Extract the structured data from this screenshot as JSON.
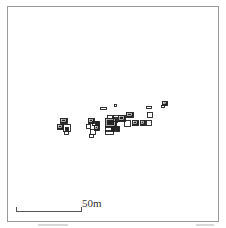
{
  "map": {
    "scale_label": "50m",
    "frame_color": "#9a9a9a",
    "feature_color": "#222222"
  },
  "features": [
    {
      "x": 60,
      "y": 118,
      "w": 7,
      "h": 5,
      "fill": true
    },
    {
      "x": 57,
      "y": 124,
      "w": 6,
      "h": 5,
      "fill": true
    },
    {
      "x": 63,
      "y": 124,
      "w": 7,
      "h": 7,
      "fill": false
    },
    {
      "x": 65,
      "y": 127,
      "w": 3,
      "h": 3,
      "fill": true
    },
    {
      "x": 64,
      "y": 131,
      "w": 4,
      "h": 3,
      "fill": false
    },
    {
      "x": 88,
      "y": 118,
      "w": 6,
      "h": 5,
      "fill": true
    },
    {
      "x": 86,
      "y": 124,
      "w": 4,
      "h": 4,
      "fill": false
    },
    {
      "x": 92,
      "y": 121,
      "w": 5,
      "h": 4,
      "fill": false
    },
    {
      "x": 95,
      "y": 121,
      "w": 4,
      "h": 4,
      "fill": true
    },
    {
      "x": 94,
      "y": 125,
      "w": 5,
      "h": 5,
      "fill": true
    },
    {
      "x": 90,
      "y": 129,
      "w": 5,
      "h": 5,
      "fill": false
    },
    {
      "x": 89,
      "y": 134,
      "w": 4,
      "h": 3,
      "fill": false
    },
    {
      "x": 107,
      "y": 115,
      "w": 5,
      "h": 5,
      "fill": false
    },
    {
      "x": 112,
      "y": 117,
      "w": 5,
      "h": 5,
      "fill": false
    },
    {
      "x": 105,
      "y": 118,
      "w": 11,
      "h": 9,
      "fill": true
    },
    {
      "x": 113,
      "y": 115,
      "w": 6,
      "h": 6,
      "fill": false
    },
    {
      "x": 118,
      "y": 115,
      "w": 7,
      "h": 6,
      "fill": true
    },
    {
      "x": 105,
      "y": 126,
      "w": 6,
      "h": 5,
      "fill": false
    },
    {
      "x": 111,
      "y": 126,
      "w": 4,
      "h": 5,
      "fill": true
    },
    {
      "x": 105,
      "y": 130,
      "w": 8,
      "h": 4,
      "fill": false
    },
    {
      "x": 116,
      "y": 126,
      "w": 3,
      "h": 5,
      "fill": true
    },
    {
      "x": 126,
      "y": 112,
      "w": 7,
      "h": 5,
      "fill": true
    },
    {
      "x": 124,
      "y": 120,
      "w": 6,
      "h": 6,
      "fill": false
    },
    {
      "x": 132,
      "y": 120,
      "w": 6,
      "h": 5,
      "fill": true
    },
    {
      "x": 140,
      "y": 120,
      "w": 5,
      "h": 5,
      "fill": true
    },
    {
      "x": 146,
      "y": 120,
      "w": 5,
      "h": 5,
      "fill": false
    },
    {
      "x": 147,
      "y": 112,
      "w": 5,
      "h": 5,
      "fill": false
    },
    {
      "x": 162,
      "y": 101,
      "w": 5,
      "h": 4,
      "fill": true
    },
    {
      "x": 161,
      "y": 105,
      "w": 3,
      "h": 2,
      "fill": false
    },
    {
      "x": 100,
      "y": 107,
      "w": 6,
      "h": 2,
      "fill": false
    },
    {
      "x": 114,
      "y": 104,
      "w": 2,
      "h": 2,
      "fill": false
    },
    {
      "x": 146,
      "y": 106,
      "w": 5,
      "h": 2,
      "fill": false
    }
  ],
  "footer_marks": [
    {
      "x": 38,
      "w": 30
    },
    {
      "x": 196,
      "w": 18
    }
  ]
}
